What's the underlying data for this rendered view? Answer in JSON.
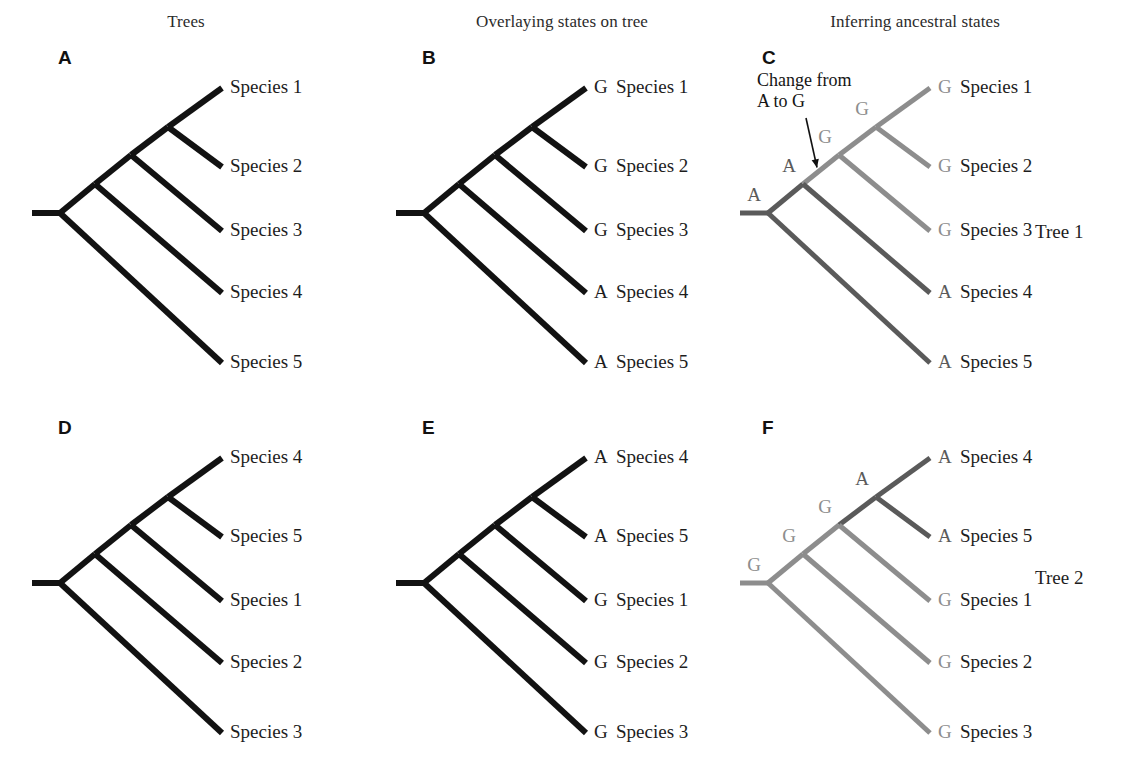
{
  "figure": {
    "columns": [
      {
        "id": "trees",
        "title": "Trees",
        "cx": 186,
        "y": 12
      },
      {
        "id": "overlay",
        "title": "Overlaying states on tree",
        "cx": 562,
        "y": 12
      },
      {
        "id": "infer",
        "title": "Inferring ancestral states",
        "cx": 915,
        "y": 12
      }
    ],
    "tree_tags": [
      {
        "id": "tree1",
        "label": "Tree 1",
        "x": 1035,
        "y": 221
      },
      {
        "id": "tree2",
        "label": "Tree 2",
        "x": 1035,
        "y": 567
      }
    ],
    "colors": {
      "black": "#121212",
      "state_A_dark": "#5a5a5a",
      "state_G_light": "#8d8d8d",
      "text": "#1d1d1d",
      "light_text": "#8d8d8d"
    },
    "annotation": {
      "line1": "Change from",
      "line2": "A to G"
    }
  },
  "panels": [
    {
      "id": "A",
      "letter": "A",
      "letter_x": 58,
      "letter_y": 47,
      "row": "top",
      "show_states": false,
      "colored": false,
      "leaves": [
        {
          "name": "Species 1",
          "state": "",
          "y": 88
        },
        {
          "name": "Species 2",
          "state": "",
          "y": 167
        },
        {
          "name": "Species 3",
          "state": "",
          "y": 231
        },
        {
          "name": "Species 4",
          "state": "",
          "y": 293
        },
        {
          "name": "Species 5",
          "state": "",
          "y": 363
        }
      ]
    },
    {
      "id": "B",
      "letter": "B",
      "letter_x": 422,
      "letter_y": 47,
      "row": "top",
      "show_states": true,
      "colored": false,
      "leaves": [
        {
          "name": "Species 1",
          "state": "G",
          "y": 88
        },
        {
          "name": "Species 2",
          "state": "G",
          "y": 167
        },
        {
          "name": "Species 3",
          "state": "G",
          "y": 231
        },
        {
          "name": "Species 4",
          "state": "A",
          "y": 293
        },
        {
          "name": "Species 5",
          "state": "A",
          "y": 363
        }
      ]
    },
    {
      "id": "C",
      "letter": "C",
      "letter_x": 762,
      "letter_y": 47,
      "row": "top",
      "show_states": true,
      "colored": true,
      "leaves": [
        {
          "name": "Species 1",
          "state": "G",
          "y": 88,
          "branch_state": "G"
        },
        {
          "name": "Species 2",
          "state": "G",
          "y": 167,
          "branch_state": "G"
        },
        {
          "name": "Species 3",
          "state": "G",
          "y": 231,
          "branch_state": "G"
        },
        {
          "name": "Species 4",
          "state": "A",
          "y": 293,
          "branch_state": "A"
        },
        {
          "name": "Species 5",
          "state": "A",
          "y": 363,
          "branch_state": "A"
        }
      ],
      "node_states": [
        {
          "id": "root",
          "label": "A",
          "state": "A"
        },
        {
          "id": "n1",
          "label": "A",
          "state": "A"
        },
        {
          "id": "n2",
          "label": "G",
          "state": "G"
        },
        {
          "id": "n3",
          "label": "G",
          "state": "G"
        }
      ]
    },
    {
      "id": "D",
      "letter": "D",
      "letter_x": 58,
      "letter_y": 417,
      "row": "bottom",
      "show_states": false,
      "colored": false,
      "leaves": [
        {
          "name": "Species 4",
          "state": "",
          "y": 458
        },
        {
          "name": "Species 5",
          "state": "",
          "y": 537
        },
        {
          "name": "Species 1",
          "state": "",
          "y": 601
        },
        {
          "name": "Species 2",
          "state": "",
          "y": 663
        },
        {
          "name": "Species 3",
          "state": "",
          "y": 733
        }
      ]
    },
    {
      "id": "E",
      "letter": "E",
      "letter_x": 422,
      "letter_y": 417,
      "row": "bottom",
      "show_states": true,
      "colored": false,
      "leaves": [
        {
          "name": "Species 4",
          "state": "A",
          "y": 458
        },
        {
          "name": "Species 5",
          "state": "A",
          "y": 537
        },
        {
          "name": "Species 1",
          "state": "G",
          "y": 601
        },
        {
          "name": "Species 2",
          "state": "G",
          "y": 663
        },
        {
          "name": "Species 3",
          "state": "G",
          "y": 733
        }
      ]
    },
    {
      "id": "F",
      "letter": "F",
      "letter_x": 762,
      "letter_y": 417,
      "row": "bottom",
      "show_states": true,
      "colored": true,
      "leaves": [
        {
          "name": "Species 4",
          "state": "A",
          "y": 458,
          "branch_state": "A"
        },
        {
          "name": "Species 5",
          "state": "A",
          "y": 537,
          "branch_state": "A"
        },
        {
          "name": "Species 1",
          "state": "G",
          "y": 601,
          "branch_state": "G"
        },
        {
          "name": "Species 2",
          "state": "G",
          "y": 663,
          "branch_state": "G"
        },
        {
          "name": "Species 3",
          "state": "G",
          "y": 733,
          "branch_state": "G"
        }
      ],
      "node_states": [
        {
          "id": "root",
          "label": "G",
          "state": "G"
        },
        {
          "id": "n1",
          "label": "G",
          "state": "G"
        },
        {
          "id": "n2",
          "label": "G",
          "state": "G"
        },
        {
          "id": "n3",
          "label": "A",
          "state": "A"
        }
      ]
    }
  ],
  "geometry": {
    "panel_x": [
      32,
      396,
      740
    ],
    "tip_x": 222,
    "state_offset": 8,
    "label_offset": 26,
    "root_stem_len": 28,
    "top_root_y": 213,
    "bottom_root_y": 583,
    "nodes_top": [
      {
        "x": 60,
        "y": 213
      },
      {
        "x": 95,
        "y": 184
      },
      {
        "x": 131,
        "y": 155
      },
      {
        "x": 168,
        "y": 127
      }
    ],
    "nodes_bottom": [
      {
        "x": 60,
        "y": 583
      },
      {
        "x": 95,
        "y": 554
      },
      {
        "x": 131,
        "y": 525
      },
      {
        "x": 168,
        "y": 497
      }
    ]
  }
}
